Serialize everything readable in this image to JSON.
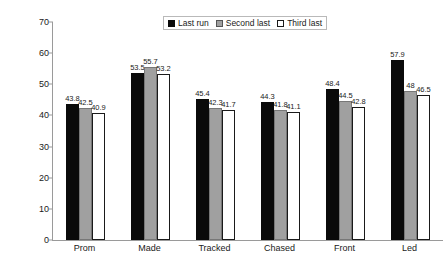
{
  "chart_data": {
    "type": "bar",
    "title": "",
    "xlabel": "",
    "ylabel": "Percentage who set the pa",
    "ylim": [
      0,
      70
    ],
    "yticks": [
      "0",
      "10",
      "20",
      "30",
      "40",
      "50",
      "60",
      "70"
    ],
    "grid": false,
    "legend_position": "top-center",
    "categories": [
      "Prom",
      "Made",
      "Tracked",
      "Chased",
      "Front",
      "Led"
    ],
    "series": [
      {
        "name": "Last run",
        "color": "#0a0a0a",
        "values": [
          43.8,
          53.5,
          45.4,
          44.3,
          48.4,
          57.9
        ],
        "labels": [
          "43.8",
          "53.5",
          "45.4",
          "44.3",
          "48.4",
          "57.9"
        ]
      },
      {
        "name": "Second last",
        "color": "#a0a0a0",
        "values": [
          42.5,
          55.7,
          42.3,
          41.8,
          44.5,
          48.0
        ],
        "labels": [
          "42.5",
          "55.7",
          "42.3",
          "41.8",
          "44.5",
          "48"
        ]
      },
      {
        "name": "Third last",
        "color": "#ffffff",
        "values": [
          40.9,
          53.2,
          41.7,
          41.1,
          42.8,
          46.5
        ],
        "labels": [
          "40.9",
          "53.2",
          "41.7",
          "41.1",
          "42.8",
          "46.5"
        ]
      }
    ]
  }
}
